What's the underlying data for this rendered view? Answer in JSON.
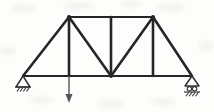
{
  "figure": {
    "title": "Simply supported planar truss with single point load",
    "type": "engineering-structural-diagram",
    "width": 214,
    "height": 112,
    "background_color": "#fdfdfc",
    "member_color": "#262626",
    "arrow_color": "#555555",
    "support_color": "#333333",
    "member_thickness": 2.6,
    "chord_thickness": 2.2
  },
  "geometry": {
    "units": "pixels",
    "nodes": [
      {
        "id": "A",
        "name": "left-support-node",
        "x": 23,
        "y": 76
      },
      {
        "id": "B",
        "name": "bottom-left-panel-node",
        "x": 69,
        "y": 76
      },
      {
        "id": "C",
        "name": "bottom-center-node",
        "x": 111,
        "y": 76
      },
      {
        "id": "D",
        "name": "bottom-right-panel-node",
        "x": 153,
        "y": 76
      },
      {
        "id": "E",
        "name": "right-support-node",
        "x": 192,
        "y": 76
      },
      {
        "id": "F",
        "name": "top-left-node",
        "x": 69,
        "y": 17
      },
      {
        "id": "G",
        "name": "top-center-node",
        "x": 111,
        "y": 17
      },
      {
        "id": "H",
        "name": "top-right-node",
        "x": 153,
        "y": 17
      }
    ],
    "members": [
      {
        "name": "bottom-chord-A-B",
        "from": "A",
        "to": "B",
        "kind": "chord"
      },
      {
        "name": "bottom-chord-B-C",
        "from": "B",
        "to": "C",
        "kind": "chord"
      },
      {
        "name": "bottom-chord-C-D",
        "from": "C",
        "to": "D",
        "kind": "chord"
      },
      {
        "name": "bottom-chord-D-E",
        "from": "D",
        "to": "E",
        "kind": "chord"
      },
      {
        "name": "top-chord-F-G",
        "from": "F",
        "to": "G",
        "kind": "chord"
      },
      {
        "name": "top-chord-G-H",
        "from": "G",
        "to": "H",
        "kind": "chord"
      },
      {
        "name": "inclined-end-post-left",
        "from": "A",
        "to": "F",
        "kind": "inclined-chord"
      },
      {
        "name": "inclined-end-post-right",
        "from": "H",
        "to": "E",
        "kind": "inclined-chord"
      },
      {
        "name": "vertical-web-F-B",
        "from": "F",
        "to": "B",
        "kind": "vertical"
      },
      {
        "name": "vertical-web-G-C",
        "from": "G",
        "to": "C",
        "kind": "vertical"
      },
      {
        "name": "vertical-web-H-D",
        "from": "H",
        "to": "D",
        "kind": "vertical"
      },
      {
        "name": "diagonal-web-F-C",
        "from": "F",
        "to": "C",
        "kind": "diagonal"
      },
      {
        "name": "diagonal-web-H-C",
        "from": "H",
        "to": "C",
        "kind": "diagonal"
      }
    ]
  },
  "supports": {
    "left": {
      "name": "pin-support",
      "type": "pinned",
      "node": "A",
      "apex_x": 23,
      "apex_y": 76,
      "triangle_half_width": 7,
      "triangle_height": 11,
      "hatch_marks": 4
    },
    "right": {
      "name": "roller-support",
      "type": "roller",
      "node": "E",
      "apex_x": 192,
      "apex_y": 76,
      "triangle_half_width": 7,
      "triangle_height": 10,
      "roller_count": 2,
      "roller_radius": 2.2,
      "hatch_marks": 4
    }
  },
  "load": {
    "name": "point-load-arrow",
    "applied_at_node": "B",
    "direction": "downward",
    "x": 69,
    "y_start": 76,
    "y_end": 103,
    "arrowhead_width": 7,
    "arrowhead_length": 9,
    "shaft_thickness": 1.4
  },
  "artifacts": {
    "description": "faint scanner smudges in background",
    "blobs": [
      {
        "x": 10,
        "y": 4,
        "w": 26,
        "h": 9
      },
      {
        "x": 62,
        "y": 2,
        "w": 34,
        "h": 8
      },
      {
        "x": 120,
        "y": 1,
        "w": 22,
        "h": 7
      },
      {
        "x": 156,
        "y": 3,
        "w": 30,
        "h": 9
      },
      {
        "x": 30,
        "y": 96,
        "w": 24,
        "h": 8
      },
      {
        "x": 96,
        "y": 100,
        "w": 30,
        "h": 8
      },
      {
        "x": 150,
        "y": 98,
        "w": 26,
        "h": 8
      },
      {
        "x": 0,
        "y": 46,
        "w": 16,
        "h": 10
      },
      {
        "x": 198,
        "y": 40,
        "w": 16,
        "h": 12
      }
    ]
  }
}
